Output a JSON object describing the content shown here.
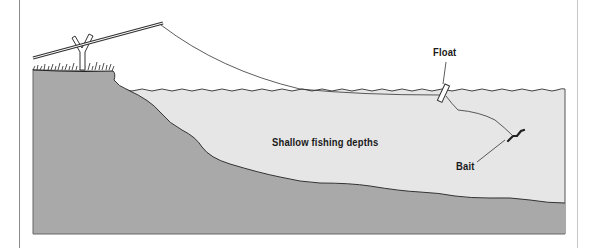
{
  "diagram": {
    "title": "Shallow fishing depths",
    "labels": {
      "float": "Float",
      "bait": "Bait",
      "depth": "Shallow fishing depths"
    },
    "colors": {
      "water": "#e6e6e6",
      "ground": "#a9a9a9",
      "line": "#333333",
      "background": "#ffffff"
    },
    "elements": [
      "fishing-rod",
      "rod-rest",
      "grass-bank",
      "fishing-line",
      "float",
      "bait",
      "water",
      "lake-bed"
    ]
  }
}
